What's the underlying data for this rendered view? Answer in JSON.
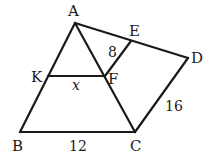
{
  "diagram": {
    "type": "geometry",
    "points": {
      "A": {
        "label": "A",
        "x": 75,
        "y": 23,
        "lx": 71,
        "ly": 16
      },
      "E": {
        "label": "E",
        "x": 131,
        "y": 41,
        "lx": 130,
        "ly": 36
      },
      "D": {
        "label": "D",
        "x": 188,
        "y": 58,
        "lx": 192,
        "ly": 63
      },
      "K": {
        "label": "K",
        "x": 48,
        "y": 76,
        "lx": 32,
        "ly": 82
      },
      "F": {
        "label": "F",
        "x": 105,
        "y": 76,
        "lx": 110,
        "ly": 84
      },
      "B": {
        "label": "B",
        "x": 20,
        "y": 132,
        "lx": 14,
        "ly": 150
      },
      "C": {
        "label": "C",
        "x": 135,
        "y": 132,
        "lx": 131,
        "ly": 150
      }
    },
    "segments": [
      [
        "A",
        "B"
      ],
      [
        "A",
        "C"
      ],
      [
        "B",
        "C"
      ],
      [
        "A",
        "D"
      ],
      [
        "D",
        "C"
      ],
      [
        "K",
        "F"
      ],
      [
        "E",
        "F"
      ]
    ],
    "measures": {
      "EF": {
        "text": "8",
        "x": 108,
        "y": 57
      },
      "KF": {
        "text": "x",
        "x": 72,
        "y": 90
      },
      "DC": {
        "text": "16",
        "x": 165,
        "y": 111
      },
      "BC": {
        "text": "12",
        "x": 69,
        "y": 150
      }
    }
  }
}
